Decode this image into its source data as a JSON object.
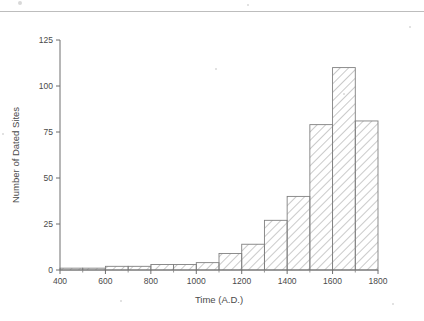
{
  "figure": {
    "background_color": "#ffffff",
    "axis_color": "#6e6e6e",
    "bar_edge_color": "#808080",
    "bar_hatch_color": "#9a9a9a"
  },
  "chart_data": {
    "type": "bar",
    "title": "",
    "xlabel": "Time (A.D.)",
    "ylabel": "Number of Dated Sites",
    "xlim": [
      400,
      1800
    ],
    "ylim": [
      0,
      125
    ],
    "xticks": [
      400,
      600,
      800,
      1000,
      1200,
      1400,
      1600,
      1800
    ],
    "xtick_labels": [
      "400",
      "600",
      "800",
      "1000",
      "1200",
      "1400",
      "1600",
      "1800"
    ],
    "yticks": [
      0,
      25,
      50,
      75,
      100,
      125
    ],
    "ytick_labels": [
      "0",
      "25",
      "50",
      "75",
      "100",
      "125"
    ],
    "minor_xticks": [
      500,
      700,
      900,
      1100,
      1300,
      1500,
      1700
    ],
    "grid": false,
    "legend": null,
    "bin_width": 100,
    "bin_edges": [
      400,
      500,
      600,
      700,
      800,
      900,
      1000,
      1100,
      1200,
      1300,
      1400,
      1500,
      1600,
      1700,
      1800
    ],
    "categories": [
      "400-500",
      "500-600",
      "600-700",
      "700-800",
      "800-900",
      "900-1000",
      "1000-1100",
      "1100-1200",
      "1200-1300",
      "1300-1400",
      "1400-1500",
      "1500-1600",
      "1600-1700",
      "1700-1800"
    ],
    "values": [
      1,
      1,
      2,
      2,
      3,
      3,
      4,
      9,
      14,
      27,
      40,
      79,
      110,
      81
    ]
  }
}
